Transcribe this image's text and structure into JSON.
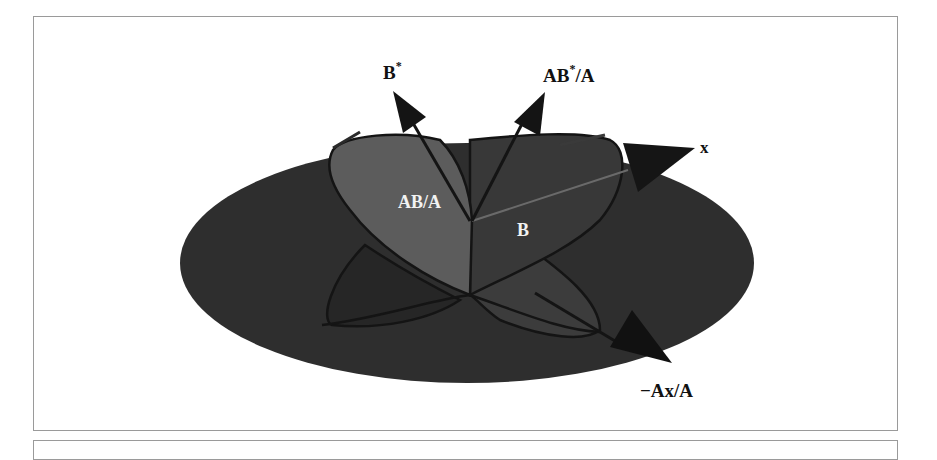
{
  "figure": {
    "labels": {
      "b_star": "B",
      "b_star_sup": "*",
      "ab_star_a_prefix": "AB",
      "ab_star_a_sup": "*",
      "ab_star_a_suffix": "/A",
      "x": "x",
      "ab_over_a": "AB/A",
      "b": "B",
      "minus_ax_over_a": "−Ax/A"
    },
    "colors": {
      "disc": "#2e2e2e",
      "plane_ab_a": "#5a5a5a",
      "plane_b": "#383838",
      "lower_lobe_left": "#262626",
      "lower_lobe_right": "#3e3e3e",
      "arrow": "#141414",
      "outline": "#1a1a1a",
      "frame": "#9a9a9a"
    }
  }
}
